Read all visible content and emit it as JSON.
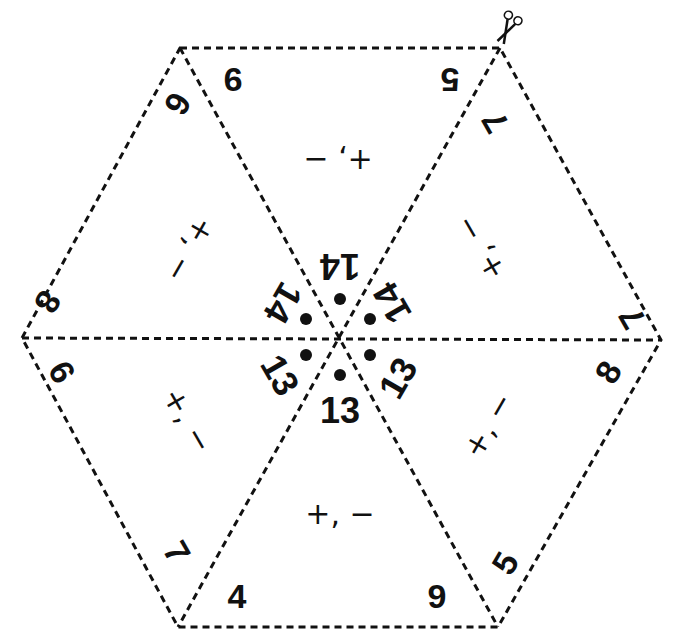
{
  "puzzle": {
    "title": "Hexagon triangle puzzle",
    "cut_icon": "scissors-icon",
    "triangles": [
      {
        "name": "top",
        "rotation": 180,
        "corner_left": "9",
        "corner_right": "5",
        "operations": "+, −",
        "center_number": "14"
      },
      {
        "name": "upper-right",
        "rotation": 240,
        "corner_left": "7",
        "corner_right": "7",
        "operations": "+, −",
        "center_number": "14"
      },
      {
        "name": "lower-right",
        "rotation": 300,
        "corner_left": "8",
        "corner_right": "5",
        "operations": "+, −",
        "center_number": "13"
      },
      {
        "name": "bottom",
        "rotation": 0,
        "corner_left": "4",
        "corner_right": "9",
        "operations": "+, −",
        "center_number": "13"
      },
      {
        "name": "lower-left",
        "rotation": 60,
        "corner_left": "7",
        "corner_right": "6",
        "operations": "+, −",
        "center_number": "13"
      },
      {
        "name": "upper-left",
        "rotation": 120,
        "corner_left": "8",
        "corner_right": "6",
        "operations": "+, −",
        "center_number": "14"
      }
    ]
  },
  "colors": {
    "line": "#111111",
    "background": "#ffffff"
  }
}
